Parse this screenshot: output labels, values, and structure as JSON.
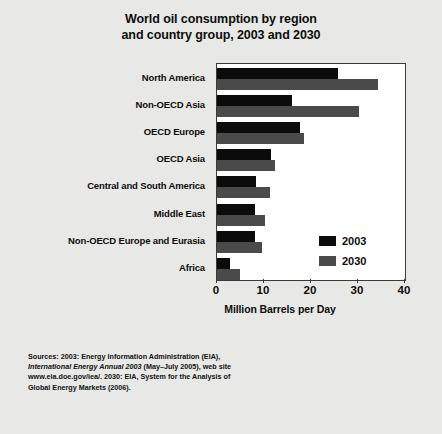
{
  "title": {
    "line1": "World oil consumption by region",
    "line2": "and country group, 2003 and 2030"
  },
  "legend": {
    "items": [
      {
        "label": "2003",
        "color": "#0b0b0b"
      },
      {
        "label": "2030",
        "color": "#4a4a4a"
      }
    ]
  },
  "axis": {
    "x_title": "Million Barrels per Day",
    "ticks": [
      "0",
      "10",
      "20",
      "30",
      "40"
    ]
  },
  "sources": {
    "line1": "Sources:  2003:  Energy Information Administration (EIA),",
    "line2": "International Energy Annual 2003",
    "line2b": " (May–July 2005), web site",
    "line3": "www.eia.doe.gov/iea/.  2030: EIA, System for the Analysis of",
    "line4": "Global Energy Markets (2006)."
  },
  "chart_data": {
    "type": "bar",
    "orientation": "horizontal",
    "title": "World oil consumption by region and country group, 2003 and 2030",
    "xlabel": "Million Barrels per Day",
    "ylabel": "",
    "xlim": [
      0,
      40
    ],
    "xticks": [
      0,
      10,
      20,
      30,
      40
    ],
    "grid": false,
    "legend_position": "inside-bottom-right",
    "categories": [
      "North America",
      "Non-OECD Asia",
      "OECD Europe",
      "OECD Asia",
      "Central and South America",
      "Middle East",
      "Non-OECD Europe and Eurasia",
      "Africa"
    ],
    "series": [
      {
        "name": "2003",
        "color": "#0b0b0b",
        "values": [
          25.7,
          16.0,
          17.6,
          11.5,
          8.3,
          8.1,
          8.0,
          2.7
        ]
      },
      {
        "name": "2030",
        "color": "#4a4a4a",
        "values": [
          34.2,
          30.2,
          18.5,
          12.3,
          11.2,
          10.2,
          9.6,
          4.9
        ]
      }
    ]
  }
}
